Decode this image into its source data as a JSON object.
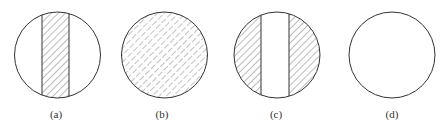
{
  "figure": {
    "background": "#ffffff",
    "stroke_color": "#333333",
    "hatch_color": "#555555",
    "panels": [
      {
        "id": "a",
        "label": "(a)",
        "cx": 57.5,
        "cy": 55,
        "r": 43,
        "hatch": "central-strip",
        "strip_x": [
          42,
          69
        ],
        "hatch_style": "solid"
      },
      {
        "id": "b",
        "label": "(b)",
        "cx": 164.5,
        "cy": 55,
        "r": 43,
        "hatch": "full",
        "hatch_style": "dashed"
      },
      {
        "id": "c",
        "label": "(c)",
        "cx": 277,
        "cy": 55,
        "r": 43,
        "hatch": "outside-strip",
        "strip_x": [
          261,
          289
        ],
        "hatch_style": "solid"
      },
      {
        "id": "d",
        "label": "(d)",
        "cx": 392,
        "cy": 55,
        "r": 43,
        "hatch": "none"
      }
    ]
  }
}
